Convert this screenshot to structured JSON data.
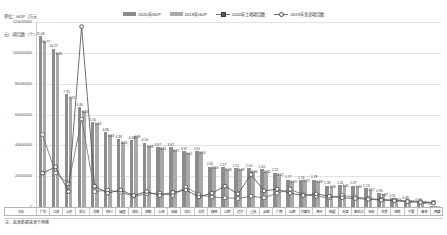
{
  "caption": {
    "line1": "单位：GDP（万元",
    "line2": "元）/项目数（个）"
  },
  "legend": {
    "position": "top-center",
    "items": [
      {
        "label": "2020年GDP",
        "type": "bar",
        "color": "#8c8c8c",
        "marker": "none"
      },
      {
        "label": "2019年GDP",
        "type": "bar",
        "color": "#a9a9a9",
        "marker": "none"
      },
      {
        "label": "2020年土地项目数",
        "type": "line",
        "color": "#6b6b6b",
        "marker": "square"
      },
      {
        "label": "2019年全途项目数",
        "type": "line",
        "color": "#6b6b6b",
        "marker": "circle"
      }
    ]
  },
  "note": "注：此表数据来源于网络",
  "xaxis_header": "地区",
  "chart_data": {
    "type": "bar",
    "title": "",
    "subtitle": "",
    "xlabel": "地区",
    "ylabel": "GDP（万元）/项目数（个）",
    "ylim": [
      0,
      120000000
    ],
    "yticks": [
      0,
      20000000,
      40000000,
      60000000,
      80000000,
      100000000,
      120000000
    ],
    "ytick_labels": [
      "0",
      "20000000",
      "40000000",
      "60000000",
      "80000000",
      "100000000",
      "120000000"
    ],
    "grid": true,
    "legend_position": "top-center",
    "categories": [
      "广东",
      "江苏",
      "山东",
      "浙江",
      "河南",
      "四川",
      "福建",
      "湖北",
      "湖南",
      "上海",
      "安徽",
      "河北",
      "北京",
      "陕西",
      "江西",
      "辽宁",
      "重庆",
      "云南",
      "广西",
      "山西",
      "内蒙古",
      "贵州",
      "新疆",
      "天津",
      "黑龙江",
      "吉林",
      "甘肃",
      "海南",
      "宁夏",
      "青海",
      "西藏"
    ],
    "series": [
      {
        "name": "2020年GDP",
        "type": "bar",
        "color": "#8c8c8c",
        "values": [
          110760900,
          102719200,
          73129000,
          64613000,
          54997400,
          48598000,
          43903900,
          43443400,
          41781500,
          38700600,
          38680500,
          36206600,
          36102600,
          26181900,
          25691600,
          25115000,
          25002800,
          24521900,
          22156700,
          17651200,
          17359900,
          17826600,
          13797500,
          14083800,
          13698700,
          12311000,
          9016700,
          5532400,
          3920500,
          3005700,
          19027
        ],
        "labels": [
          "11.08",
          "10.27",
          "7.31",
          "6.46",
          "5.50",
          "4.86",
          "4.39",
          "4.34",
          "4.18",
          "3.87",
          "3.87",
          "3.62",
          "3.61",
          "2.62",
          "2.57",
          "2.51",
          "2.50",
          "2.45",
          "2.22",
          "1.77",
          "1.74",
          "1.78",
          "1.38",
          "1.41",
          "1.37",
          "1.23",
          "0.90",
          "0.55",
          "0.39",
          "0.30",
          "0.19"
        ]
      },
      {
        "name": "2019年GDP",
        "type": "bar",
        "color": "#a9a9a9",
        "values": [
          107671200,
          99631600,
          71067700,
          62351900,
          54259700,
          46615800,
          42395000,
          45828400,
          39752500,
          38155400,
          37114000,
          35104500,
          35371300,
          25793000,
          24757400,
          24909200,
          23605900,
          23223800,
          21237000,
          17026800,
          17212100,
          16769100,
          13597100,
          14104100,
          13612100,
          11726400,
          8718200,
          5308200,
          3748600,
          2965900,
          16977
        ],
        "labels": [
          "10.77",
          "9.96",
          "7.11",
          "6.24",
          "5.43",
          "4.66",
          "4.24",
          "4.58",
          "3.98",
          "3.82",
          "3.71",
          "3.51",
          "3.54",
          "2.58",
          "2.48",
          "2.49",
          "2.36",
          "2.32",
          "2.12",
          "1.70",
          "1.72",
          "1.68",
          "1.36",
          "1.41",
          "1.36",
          "1.17",
          "0.87",
          "0.53",
          "0.37",
          "0.30",
          "0.17"
        ]
      },
      {
        "name": "2020年土地项目数",
        "type": "line",
        "color": "#6b6b6b",
        "marker": "square",
        "values": [
          47000000,
          22000000,
          15000000,
          57000000,
          10000000,
          11000000,
          9500000,
          7000000,
          8500000,
          9000000,
          7500000,
          13000000,
          8000000,
          6500000,
          6000000,
          5500000,
          7000000,
          6000000,
          9000000,
          11500000,
          8000000,
          7000000,
          6000000,
          7500000,
          6500000,
          5500000,
          5000000,
          4500000,
          4000000,
          3500000,
          3000000
        ]
      },
      {
        "name": "2019年全途项目数",
        "type": "line",
        "color": "#4a4a4a",
        "marker": "circle",
        "values": [
          22000000,
          26000000,
          10000000,
          117000000,
          13500000,
          9000000,
          11000000,
          7500000,
          10000000,
          7500000,
          9500000,
          11000000,
          6500000,
          9000000,
          13500000,
          8500000,
          21000000,
          10500000,
          11500000,
          9000000,
          7500000,
          8500000,
          7000000,
          6000000,
          5500000,
          5000000,
          4500000,
          4000000,
          3500000,
          3000000,
          2500000
        ]
      }
    ]
  }
}
